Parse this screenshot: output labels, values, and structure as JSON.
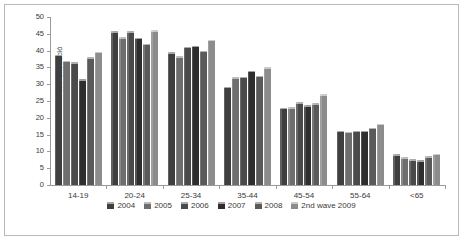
{
  "chart_data": {
    "type": "bar",
    "title": "",
    "xlabel": "",
    "ylabel": "% Penetració",
    "ylim": [
      0,
      50
    ],
    "yticks": [
      0,
      5,
      10,
      15,
      20,
      25,
      30,
      35,
      40,
      45,
      50
    ],
    "grid": false,
    "legend_position": "bottom",
    "categories": [
      "14-19",
      "20-24",
      "25-34",
      "35-44",
      "45-54",
      "55-64",
      "<65"
    ],
    "series": [
      {
        "name": "2004",
        "color": "#3f3f3f",
        "values": [
          38.7,
          45.8,
          39.5,
          29.3,
          23.0,
          16.1,
          9.1
        ]
      },
      {
        "name": "2005",
        "color": "#6e6e6e",
        "values": [
          37.0,
          44.0,
          38.3,
          32.0,
          23.2,
          15.9,
          8.3
        ]
      },
      {
        "name": "2006",
        "color": "#4a4a4a",
        "values": [
          36.5,
          45.7,
          41.2,
          32.2,
          24.6,
          16.2,
          7.6
        ]
      },
      {
        "name": "2007",
        "color": "#2e2e2e",
        "values": [
          31.5,
          43.9,
          41.5,
          34.0,
          23.7,
          16.1,
          7.3
        ]
      },
      {
        "name": "2008",
        "color": "#5a5a5a",
        "values": [
          38.0,
          42.0,
          40.0,
          32.5,
          24.4,
          17.0,
          8.5
        ]
      },
      {
        "name": "2nd wave 2009",
        "color": "#8c8c8c",
        "values": [
          39.7,
          46.0,
          43.3,
          35.0,
          27.0,
          18.3,
          9.3
        ]
      }
    ]
  },
  "axis": {
    "y_title": "% Penetració",
    "y_tick_labels": [
      "50",
      "45",
      "40",
      "35",
      "30",
      "25",
      "20",
      "15",
      "10",
      "5",
      "0"
    ],
    "x_tick_labels": [
      "14-19",
      "20-24",
      "25-34",
      "35-44",
      "45-54",
      "55-64",
      "<65"
    ]
  },
  "legend": {
    "items": [
      {
        "label": "2004"
      },
      {
        "label": "2005"
      },
      {
        "label": "2006"
      },
      {
        "label": "2007"
      },
      {
        "label": "2008"
      },
      {
        "label": "2nd wave 2009"
      }
    ]
  }
}
